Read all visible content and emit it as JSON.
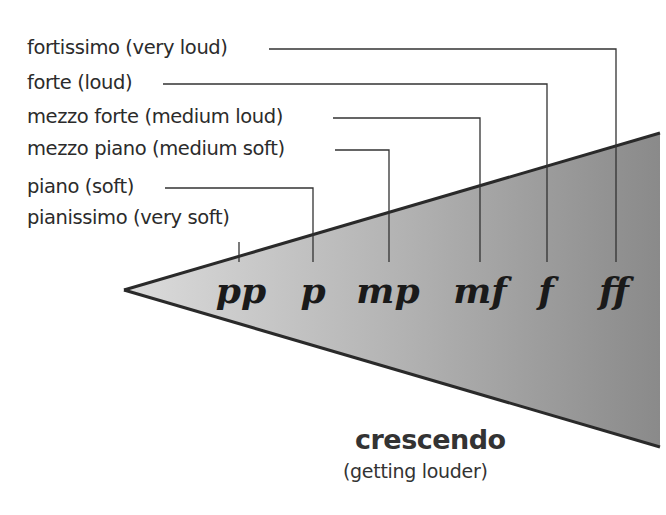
{
  "labels": [
    {
      "term": "fortissimo (very loud)",
      "symbol": "ff"
    },
    {
      "term": "forte (loud)",
      "symbol": "f"
    },
    {
      "term": "mezzo forte (medium loud)",
      "symbol": "mf"
    },
    {
      "term": "mezzo piano (medium soft)",
      "symbol": "mp"
    },
    {
      "term": "piano (soft)",
      "symbol": "p"
    },
    {
      "term": "pianissimo (very soft)",
      "symbol": "pp"
    }
  ],
  "crescendo": {
    "title": "crescendo",
    "subtitle": "(getting louder)"
  },
  "colors": {
    "wedge_light": "#d9d9d9",
    "wedge_dark": "#8c8c8c",
    "line": "#2a2a2a"
  }
}
